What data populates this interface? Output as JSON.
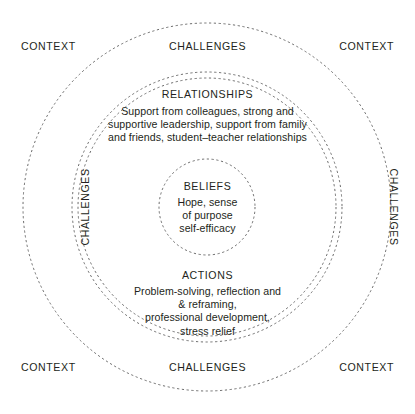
{
  "diagram": {
    "type": "concentric-rings",
    "background_color": "#ffffff",
    "stroke_color": "#6d6d6d",
    "text_color": "#231f20",
    "width": 415,
    "height": 414,
    "center": {
      "x": 207,
      "y": 207
    },
    "rings": [
      {
        "name": "context-ring",
        "radius": 184,
        "style": "dashed"
      },
      {
        "name": "challenges-ring",
        "radius": 135,
        "style": "dashed"
      },
      {
        "name": "relationships-ring",
        "radius": 129,
        "style": "dashed"
      },
      {
        "name": "beliefs-ring",
        "radius": 48,
        "style": "dashed"
      }
    ]
  },
  "layers": {
    "relationships": {
      "title": "RELATIONSHIPS",
      "lines": [
        "Support from colleagues, strong and",
        "supportive leadership, support from family",
        "and friends, student–teacher relationships"
      ]
    },
    "beliefs": {
      "title": "BELIEFS",
      "lines": [
        "Hope, sense",
        "of purpose",
        "self-efficacy"
      ]
    },
    "actions": {
      "title": "ACTIONS",
      "lines": [
        "Problem-solving, reflection and",
        "& reframing,",
        "professional development,",
        "stress relief"
      ]
    }
  },
  "edge_labels": {
    "context_top_left": "CONTEXT",
    "context_top_right": "CONTEXT",
    "context_bottom_left": "CONTEXT",
    "context_bottom_right": "CONTEXT",
    "challenges_top": "CHALLENGES",
    "challenges_bottom": "CHALLENGES",
    "challenges_left": "CHALLENGES",
    "challenges_right": "CHALLENGES"
  }
}
